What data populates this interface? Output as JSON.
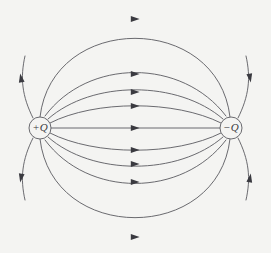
{
  "figure": {
    "background_color": "#f4f4f2",
    "line_color": "#5a5a60",
    "arrow_color": "#3a3a40",
    "width": 271,
    "height": 253
  },
  "charges": [
    {
      "id": "positive-charge",
      "label": "+Q",
      "sign": "positive",
      "cx": 40,
      "cy": 128,
      "r": 11
    },
    {
      "id": "negative-charge",
      "label": "−Q",
      "sign": "negative",
      "cx": 231,
      "cy": 128,
      "r": 11
    }
  ],
  "chart_data": {
    "type": "line",
    "xlabel": "",
    "ylabel": "",
    "xlim": [
      0,
      271
    ],
    "ylim": [
      0,
      253
    ],
    "grid": false,
    "legend": "none",
    "annotations": [
      {
        "text": "+Q",
        "x": 40,
        "y": 128
      },
      {
        "text": "−Q",
        "x": 231,
        "y": 128
      }
    ],
    "series": [
      {
        "name": "axis-line",
        "kind": "straight",
        "path": "M 51 128 L 220 128",
        "arrows": [
          {
            "x": 135,
            "y": 128,
            "angle": 0
          }
        ]
      },
      {
        "name": "inner-arc-up-1",
        "kind": "connecting",
        "path": "M 50 123 C 95 100, 175 100, 221 123",
        "arrows": [
          {
            "x": 135,
            "y": 106,
            "angle": 0
          }
        ]
      },
      {
        "name": "inner-arc-up-2",
        "kind": "connecting",
        "path": "M 48 119 C 92 80, 178 80, 223 119",
        "arrows": [
          {
            "x": 135,
            "y": 92,
            "angle": 0
          }
        ]
      },
      {
        "name": "inner-arc-up-3",
        "kind": "connecting",
        "path": "M 45 116 C 88 58, 182 58, 226 116",
        "arrows": [
          {
            "x": 135,
            "y": 74,
            "angle": 0
          }
        ]
      },
      {
        "name": "outer-arc-up",
        "kind": "connecting",
        "path": "M 40 117 C 52 12, 218 12, 230 117",
        "arrows": [
          {
            "x": 135,
            "y": 19,
            "angle": 0
          }
        ]
      },
      {
        "name": "inner-arc-down-1",
        "kind": "connecting",
        "path": "M 50 133 C 95 156, 175 156, 221 133",
        "arrows": [
          {
            "x": 135,
            "y": 150,
            "angle": 0
          }
        ]
      },
      {
        "name": "inner-arc-down-2",
        "kind": "connecting",
        "path": "M 48 137 C 92 176, 178 176, 223 137",
        "arrows": [
          {
            "x": 135,
            "y": 164,
            "angle": 0
          }
        ]
      },
      {
        "name": "inner-arc-down-3",
        "kind": "connecting",
        "path": "M 45 140 C 88 198, 182 198, 226 140",
        "arrows": [
          {
            "x": 135,
            "y": 182,
            "angle": 0
          }
        ]
      },
      {
        "name": "outer-arc-down",
        "kind": "connecting",
        "path": "M 40 139 C 52 244, 218 244, 230 139",
        "arrows": [
          {
            "x": 135,
            "y": 237,
            "angle": 0
          }
        ]
      },
      {
        "name": "escape-upper-left",
        "kind": "escaping",
        "path": "M 33 118 C 22 96, 20 78, 25 56",
        "arrows": [
          {
            "x": 21,
            "y": 78,
            "angle": -100
          }
        ]
      },
      {
        "name": "escape-lower-left",
        "kind": "escaping",
        "path": "M 33 138 C 22 160, 20 178, 25 200",
        "arrows": [
          {
            "x": 21,
            "y": 178,
            "angle": 100
          }
        ]
      },
      {
        "name": "escape-upper-right",
        "kind": "entering",
        "path": "M 246 56 C 251 78, 249 96, 238 118",
        "arrows": [
          {
            "x": 250,
            "y": 78,
            "angle": 80
          }
        ]
      },
      {
        "name": "escape-lower-right",
        "kind": "entering",
        "path": "M 246 200 C 251 178, 249 160, 238 138",
        "arrows": [
          {
            "x": 250,
            "y": 178,
            "angle": -80
          }
        ]
      }
    ]
  }
}
